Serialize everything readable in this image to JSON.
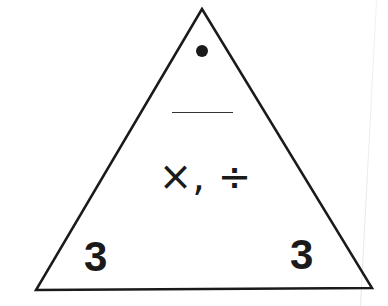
{
  "diagram": {
    "type": "fact-family-triangle",
    "top": {
      "value": "•",
      "description": "filled dot placeholder"
    },
    "answer_blank": "",
    "operations": "×, ÷",
    "bottom_left": "3",
    "bottom_right": "3"
  },
  "colors": {
    "stroke": "#1a1a1a",
    "background": "#ffffff"
  }
}
